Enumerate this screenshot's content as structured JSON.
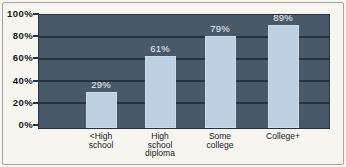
{
  "chart_data": {
    "type": "bar",
    "title": "",
    "xlabel": "",
    "ylabel": "",
    "categories": [
      "<High\nschool",
      "High\nschool\ndiploma",
      "Some\ncollege",
      "College+"
    ],
    "values": [
      29,
      61,
      79,
      89
    ],
    "value_labels": [
      "29%",
      "61%",
      "79%",
      "89%"
    ],
    "yticks": [
      "100%",
      "80%",
      "60%",
      "40%",
      "20%",
      "0%"
    ],
    "ylim": [
      0,
      100
    ],
    "grid": "horizontal gridlines at 20% intervals",
    "legend": "none",
    "colors": {
      "plot_background": "#4a5969",
      "gridline": "#273140",
      "bar_fill": "#bdcfe1",
      "value_label_text": "#eef2f7",
      "axis_text": "#15181c",
      "card_background": "#f7f5ef",
      "card_border": "#a5a49d"
    }
  }
}
